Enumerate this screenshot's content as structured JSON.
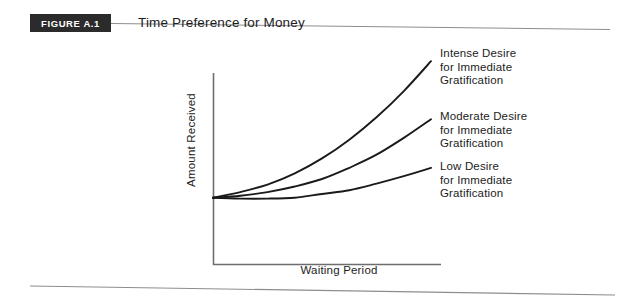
{
  "figure": {
    "badge_label": "FIGURE A.1",
    "title": "Time Preference for Money"
  },
  "chart_data": {
    "type": "line",
    "title": "Time Preference for Money",
    "xlabel": "Waiting Period",
    "ylabel": "Amount Received",
    "grid": false,
    "legend_position": "right-inline-annotations",
    "axis_style": "qualitative (no tick marks, no numeric scale)",
    "xlim": [
      0,
      1
    ],
    "ylim": [
      0,
      1
    ],
    "origin_note": "All three curves share a common origin at the y-intercept on the vertical axis.",
    "x": [
      0.0,
      0.125,
      0.25,
      0.375,
      0.5,
      0.625,
      0.75,
      0.875,
      1.0
    ],
    "series": [
      {
        "name": "Intense Desire for Immediate Gratification",
        "label_lines": [
          "Intense Desire",
          "for Immediate",
          "Gratification"
        ],
        "color": "#1a1a1a",
        "curvature": "steep exponential",
        "values": [
          0.36,
          0.39,
          0.43,
          0.49,
          0.57,
          0.67,
          0.79,
          0.93,
          1.09
        ]
      },
      {
        "name": "Moderate Desire for Immediate Gratification",
        "label_lines": [
          "Moderate Desire",
          "for Immediate",
          "Gratification"
        ],
        "color": "#1a1a1a",
        "curvature": "moderate exponential",
        "values": [
          0.36,
          0.37,
          0.39,
          0.42,
          0.46,
          0.52,
          0.59,
          0.68,
          0.78
        ]
      },
      {
        "name": "Low Desire for Immediate Gratification",
        "label_lines": [
          "Low Desire",
          "for Immediate",
          "Gratification"
        ],
        "color": "#1a1a1a",
        "curvature": "shallow, nearly flat",
        "values": [
          0.36,
          0.355,
          0.355,
          0.36,
          0.38,
          0.4,
          0.435,
          0.475,
          0.52
        ]
      }
    ]
  },
  "colors": {
    "badge_background": "#2b2b2b",
    "badge_text": "#ffffff",
    "ink": "#1d1d1d",
    "axis": "#6e6e6e",
    "rule": "#8d8d8d",
    "page_background": "#ffffff"
  }
}
